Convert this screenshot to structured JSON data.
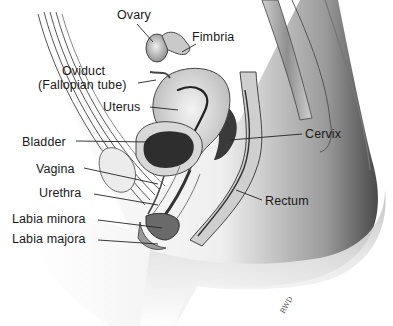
{
  "figure": {
    "type": "anatomical-illustration",
    "labels": [
      {
        "id": "ovary",
        "text": "Ovary",
        "x": 117,
        "y": 8
      },
      {
        "id": "fimbria",
        "text": "Fimbria",
        "x": 192,
        "y": 30
      },
      {
        "id": "oviduct_1",
        "text": "Oviduct",
        "x": 62,
        "y": 64
      },
      {
        "id": "oviduct_2",
        "text": "(Fallopian tube)",
        "x": 38,
        "y": 78
      },
      {
        "id": "uterus",
        "text": "Uterus",
        "x": 103,
        "y": 100
      },
      {
        "id": "bladder",
        "text": "Bladder",
        "x": 22,
        "y": 135
      },
      {
        "id": "cervix",
        "text": "Cervix",
        "x": 305,
        "y": 127
      },
      {
        "id": "vagina",
        "text": "Vagina",
        "x": 36,
        "y": 162
      },
      {
        "id": "urethra",
        "text": "Urethra",
        "x": 39,
        "y": 186
      },
      {
        "id": "rectum",
        "text": "Rectum",
        "x": 265,
        "y": 194
      },
      {
        "id": "labia_minora",
        "text": "Labia minora",
        "x": 12,
        "y": 212
      },
      {
        "id": "labia_majora",
        "text": "Labia majora",
        "x": 12,
        "y": 232
      }
    ],
    "signature": "RWD"
  },
  "colors": {
    "background": "#ffffff",
    "ink": "#1a1a1a",
    "tissue_light": "#e6e6e6",
    "tissue_mid": "#bdbdbd",
    "tissue_dark": "#5a5a5a",
    "cavity": "#2b2b2b"
  }
}
